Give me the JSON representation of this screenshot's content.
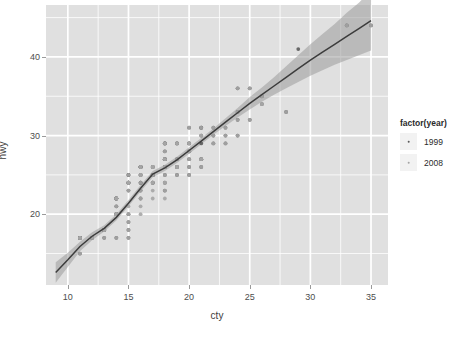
{
  "chart_data": {
    "type": "scatter",
    "title": "",
    "xlabel": "cty",
    "ylabel": "hwy",
    "xlim": [
      8.2,
      36.4
    ],
    "ylim": [
      11.0,
      46.6
    ],
    "xticks": [
      10,
      15,
      20,
      25,
      30,
      35
    ],
    "yticks": [
      20,
      30,
      40
    ],
    "xticks_minor": [
      12.5,
      17.5,
      22.5,
      27.5,
      32.5
    ],
    "yticks_minor": [
      15,
      25,
      35,
      45
    ],
    "grid": "major-and-minor-white-on-gray",
    "legend_position": "right",
    "legend_title": "factor(year)",
    "panel_bg": "#e0e0e0",
    "grid_color": "#ffffff",
    "smooth": {
      "method": "loess",
      "line_color": "#3c3c3c",
      "band_color": "#9a9a9a",
      "band_opacity": 0.55,
      "x": [
        9,
        10,
        11,
        12,
        13,
        14,
        15,
        16,
        17,
        18,
        19,
        20,
        21,
        22,
        23,
        24,
        25,
        26,
        27,
        28,
        29,
        30,
        31,
        32,
        33,
        34,
        35
      ],
      "y": [
        12.6,
        14.2,
        15.9,
        17.2,
        18.2,
        19.6,
        21.4,
        23.3,
        25.1,
        25.9,
        26.9,
        28.1,
        29.3,
        30.5,
        31.7,
        32.9,
        34.1,
        35.2,
        36.3,
        37.4,
        38.5,
        39.6,
        40.6,
        41.6,
        42.6,
        43.6,
        44.6
      ],
      "ymin": [
        11.3,
        13.3,
        15.3,
        16.7,
        17.8,
        19.2,
        21.0,
        22.9,
        24.7,
        25.5,
        26.5,
        27.7,
        28.9,
        30.1,
        31.2,
        32.3,
        33.3,
        34.3,
        35.2,
        36.0,
        36.8,
        37.6,
        38.3,
        39.0,
        39.6,
        40.2,
        40.8
      ],
      "ymax": [
        13.9,
        15.1,
        16.5,
        17.7,
        18.6,
        20.0,
        21.8,
        23.7,
        25.5,
        26.3,
        27.3,
        28.5,
        29.7,
        30.9,
        32.2,
        33.5,
        34.9,
        36.1,
        37.4,
        38.8,
        40.2,
        41.6,
        42.9,
        44.2,
        45.6,
        46.9,
        48.4
      ]
    },
    "series": [
      {
        "name": "1999",
        "color": "#5a5a5a",
        "points": [
          [
            18,
            29
          ],
          [
            21,
            29
          ],
          [
            20,
            31
          ],
          [
            16,
            26
          ],
          [
            18,
            26
          ],
          [
            18,
            27
          ],
          [
            16,
            25
          ],
          [
            18,
            28
          ],
          [
            18,
            27
          ],
          [
            15,
            25
          ],
          [
            17,
            25
          ],
          [
            16,
            25
          ],
          [
            14,
            22
          ],
          [
            11,
            17
          ],
          [
            14,
            20
          ],
          [
            13,
            18
          ],
          [
            12,
            17
          ],
          [
            16,
            26
          ],
          [
            15,
            25
          ],
          [
            16,
            26
          ],
          [
            15,
            24
          ],
          [
            17,
            25
          ],
          [
            17,
            26
          ],
          [
            15,
            23
          ],
          [
            15,
            24
          ],
          [
            17,
            25
          ],
          [
            16,
            26
          ],
          [
            14,
            21
          ],
          [
            11,
            17
          ],
          [
            11,
            17
          ],
          [
            14,
            20
          ],
          [
            13,
            18
          ],
          [
            11,
            15
          ],
          [
            11,
            17
          ],
          [
            14,
            22
          ],
          [
            13,
            18
          ],
          [
            13,
            18
          ],
          [
            14,
            20
          ],
          [
            11,
            17
          ],
          [
            14,
            20
          ],
          [
            13,
            17
          ],
          [
            12,
            17
          ],
          [
            13,
            18
          ],
          [
            14,
            22
          ],
          [
            14,
            22
          ],
          [
            15,
            24
          ],
          [
            16,
            24
          ],
          [
            15,
            24
          ],
          [
            16,
            26
          ],
          [
            17,
            26
          ],
          [
            18,
            27
          ],
          [
            18,
            26
          ],
          [
            20,
            28
          ],
          [
            19,
            27
          ],
          [
            20,
            29
          ],
          [
            18,
            26
          ],
          [
            17,
            25
          ],
          [
            16,
            24
          ],
          [
            20,
            28
          ],
          [
            21,
            31
          ],
          [
            21,
            31
          ],
          [
            20,
            29
          ],
          [
            21,
            30
          ],
          [
            23,
            31
          ],
          [
            22,
            31
          ],
          [
            24,
            32
          ],
          [
            26,
            34
          ],
          [
            29,
            41
          ],
          [
            33,
            44
          ],
          [
            35,
            44
          ],
          [
            25,
            36
          ],
          [
            24,
            36
          ],
          [
            25,
            32
          ],
          [
            28,
            33
          ],
          [
            23,
            30
          ],
          [
            22,
            30
          ],
          [
            21,
            27
          ],
          [
            19,
            29
          ],
          [
            19,
            26
          ],
          [
            18,
            24
          ],
          [
            17,
            24
          ],
          [
            16,
            23
          ],
          [
            15,
            20
          ],
          [
            15,
            19
          ],
          [
            15,
            18
          ],
          [
            14,
            17
          ],
          [
            19,
            25
          ],
          [
            18,
            25
          ],
          [
            17,
            24
          ],
          [
            15,
            17
          ],
          [
            16,
            22
          ],
          [
            18,
            23
          ],
          [
            20,
            26
          ],
          [
            21,
            26
          ],
          [
            20,
            25
          ],
          [
            19,
            26
          ],
          [
            18,
            29
          ],
          [
            18,
            29
          ],
          [
            19,
            29
          ],
          [
            20,
            27
          ],
          [
            21,
            27
          ],
          [
            22,
            29
          ],
          [
            24,
            33
          ],
          [
            26,
            35
          ],
          [
            23,
            29
          ],
          [
            24,
            30
          ]
        ]
      },
      {
        "name": "2008",
        "color": "#a5a5a5",
        "points": [
          [
            18,
            29
          ],
          [
            21,
            30
          ],
          [
            20,
            31
          ],
          [
            16,
            26
          ],
          [
            18,
            26
          ],
          [
            18,
            28
          ],
          [
            16,
            25
          ],
          [
            18,
            27
          ],
          [
            15,
            24
          ],
          [
            17,
            26
          ],
          [
            16,
            25
          ],
          [
            14,
            21
          ],
          [
            11,
            17
          ],
          [
            14,
            20
          ],
          [
            13,
            18
          ],
          [
            12,
            17
          ],
          [
            16,
            25
          ],
          [
            15,
            24
          ],
          [
            16,
            26
          ],
          [
            15,
            23
          ],
          [
            17,
            25
          ],
          [
            17,
            26
          ],
          [
            15,
            24
          ],
          [
            16,
            25
          ],
          [
            14,
            22
          ],
          [
            11,
            17
          ],
          [
            14,
            20
          ],
          [
            13,
            18
          ],
          [
            11,
            15
          ],
          [
            14,
            22
          ],
          [
            13,
            18
          ],
          [
            14,
            20
          ],
          [
            11,
            17
          ],
          [
            13,
            17
          ],
          [
            12,
            17
          ],
          [
            13,
            18
          ],
          [
            14,
            22
          ],
          [
            15,
            24
          ],
          [
            16,
            24
          ],
          [
            16,
            26
          ],
          [
            17,
            26
          ],
          [
            18,
            27
          ],
          [
            18,
            26
          ],
          [
            20,
            28
          ],
          [
            19,
            27
          ],
          [
            20,
            29
          ],
          [
            18,
            26
          ],
          [
            17,
            25
          ],
          [
            20,
            28
          ],
          [
            21,
            31
          ],
          [
            20,
            29
          ],
          [
            21,
            30
          ],
          [
            23,
            31
          ],
          [
            22,
            31
          ],
          [
            24,
            32
          ],
          [
            26,
            34
          ],
          [
            26,
            34
          ],
          [
            33,
            44
          ],
          [
            35,
            44
          ],
          [
            25,
            36
          ],
          [
            24,
            36
          ],
          [
            25,
            32
          ],
          [
            28,
            33
          ],
          [
            23,
            30
          ],
          [
            22,
            30
          ],
          [
            21,
            27
          ],
          [
            19,
            29
          ],
          [
            19,
            26
          ],
          [
            18,
            24
          ],
          [
            17,
            24
          ],
          [
            16,
            23
          ],
          [
            15,
            20
          ],
          [
            15,
            19
          ],
          [
            15,
            18
          ],
          [
            14,
            17
          ],
          [
            19,
            25
          ],
          [
            18,
            25
          ],
          [
            17,
            24
          ],
          [
            15,
            17
          ],
          [
            16,
            22
          ],
          [
            18,
            23
          ],
          [
            20,
            26
          ],
          [
            21,
            26
          ],
          [
            20,
            25
          ],
          [
            19,
            26
          ],
          [
            18,
            29
          ],
          [
            19,
            29
          ],
          [
            20,
            27
          ],
          [
            21,
            27
          ],
          [
            22,
            29
          ],
          [
            24,
            33
          ],
          [
            26,
            35
          ],
          [
            23,
            29
          ],
          [
            24,
            30
          ],
          [
            16,
            20
          ],
          [
            15,
            25
          ],
          [
            18,
            22
          ],
          [
            17,
            22
          ],
          [
            15,
            21
          ],
          [
            16,
            21
          ],
          [
            18,
            24
          ],
          [
            17,
            23
          ]
        ]
      }
    ]
  },
  "legend": {
    "title": "factor(year)",
    "items": [
      {
        "label": "1999",
        "color": "#5a5a5a"
      },
      {
        "label": "2008",
        "color": "#a5a5a5"
      }
    ]
  },
  "axes": {
    "x_title": "cty",
    "y_title": "hwy",
    "x_tick_labels": [
      "10",
      "15",
      "20",
      "25",
      "30",
      "35"
    ],
    "y_tick_labels": [
      "20",
      "30",
      "40"
    ]
  }
}
